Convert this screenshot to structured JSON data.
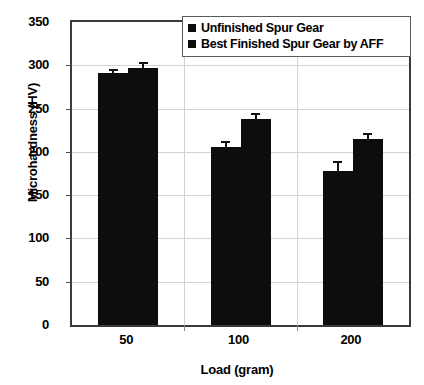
{
  "chart_data": {
    "type": "bar",
    "title": "",
    "xlabel": "Load (gram)",
    "ylabel": "Microhardness (HV)",
    "categories": [
      "50",
      "100",
      "200"
    ],
    "ylim": [
      0,
      350
    ],
    "ytick_labels": [
      "0",
      "50",
      "100",
      "150",
      "200",
      "250",
      "300",
      "350"
    ],
    "ytick_values": [
      0,
      50,
      100,
      150,
      200,
      250,
      300,
      350
    ],
    "grid": true,
    "legend_position": "top-right",
    "bar_color": "#0d0d0d",
    "series": [
      {
        "name": "Unfinished Spur Gear",
        "values": [
          291,
          206,
          178
        ],
        "errors": [
          5,
          6,
          12
        ]
      },
      {
        "name": "Best Finished Spur Gear by AFF",
        "values": [
          297,
          238,
          215
        ]
      }
    ]
  },
  "legend": {
    "items": [
      {
        "label": "Unfinished Spur Gear",
        "marker": "square-marker",
        "color": "#0d0d0d"
      },
      {
        "label": "Best Finished Spur Gear by AFF",
        "marker": "square-marker",
        "color": "#0d0d0d"
      }
    ]
  }
}
